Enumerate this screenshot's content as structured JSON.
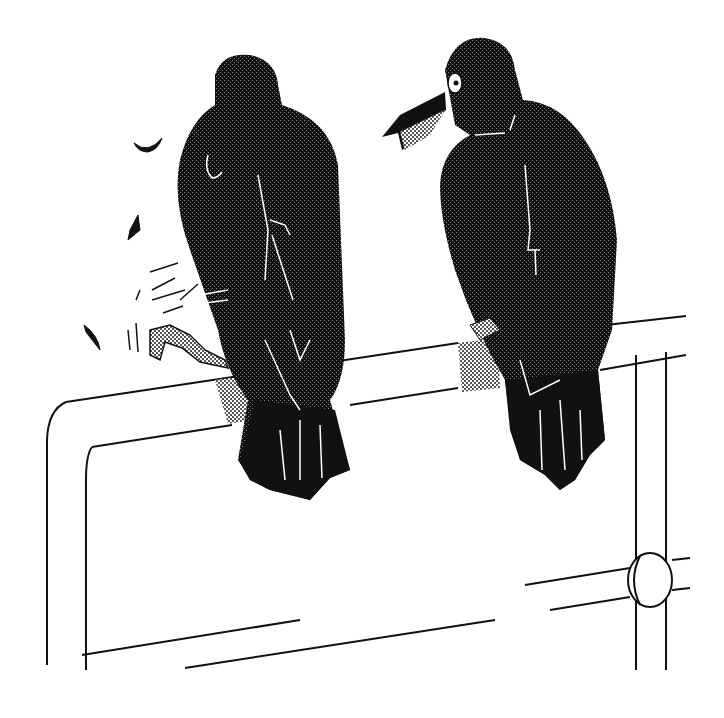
{
  "illustration": {
    "subject": "Two crows perched on a fence rail",
    "style": "monochrome dithered bitmap",
    "colors": {
      "background": "#ffffff",
      "ink": "#111111",
      "dither": "#bdbdbd",
      "highlight": "#ffffff"
    },
    "elements": [
      {
        "name": "crow-left",
        "description": "crow seen from behind, scratching with one foot"
      },
      {
        "name": "crow-right",
        "description": "crow facing left with open beak"
      },
      {
        "name": "fence",
        "description": "metal pipe fence with rounded corner and coupling"
      },
      {
        "name": "motion-marks",
        "description": "scratching motion lines and flying bits"
      }
    ]
  }
}
